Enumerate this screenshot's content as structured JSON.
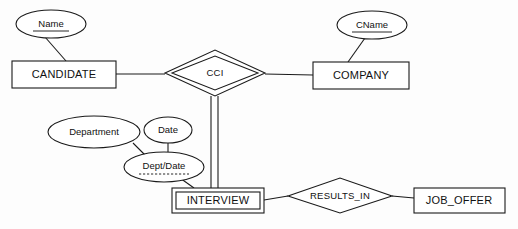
{
  "diagram": {
    "notation": "Chen",
    "background_color": "#fdfdfd",
    "line_color": "#1a1a1a",
    "text_color": "#111111"
  },
  "entities": [
    {
      "id": "candidate",
      "label": "CANDIDATE",
      "kind": "strong-entity",
      "x": 12,
      "y": 61,
      "w": 104,
      "h": 27
    },
    {
      "id": "company",
      "label": "COMPANY",
      "kind": "strong-entity",
      "x": 313,
      "y": 62,
      "w": 96,
      "h": 27
    },
    {
      "id": "interview",
      "label": "INTERVIEW",
      "kind": "weak-entity",
      "x": 172,
      "y": 188,
      "w": 92,
      "h": 25
    },
    {
      "id": "job_offer",
      "label": "JOB_OFFER",
      "kind": "strong-entity",
      "x": 414,
      "y": 188,
      "w": 91,
      "h": 25
    }
  ],
  "relationships": [
    {
      "id": "cci",
      "label": "CCI",
      "kind": "identifying-relationship",
      "cx": 215,
      "cy": 73,
      "rx": 50,
      "ry": 23
    },
    {
      "id": "results_in",
      "label": "RESULTS_IN",
      "kind": "relationship",
      "cx": 340,
      "cy": 195,
      "rx": 52,
      "ry": 17
    }
  ],
  "attributes": [
    {
      "id": "name",
      "label": "Name",
      "kind": "key-attribute",
      "underline": "solid",
      "cx": 51,
      "cy": 24,
      "rx": 35,
      "ry": 14
    },
    {
      "id": "cname",
      "label": "CName",
      "kind": "key-attribute",
      "underline": "solid",
      "cx": 372,
      "cy": 25,
      "rx": 35,
      "ry": 14
    },
    {
      "id": "department",
      "label": "Department",
      "kind": "attribute",
      "underline": "none",
      "cx": 94,
      "cy": 132,
      "rx": 46,
      "ry": 16
    },
    {
      "id": "date",
      "label": "Date",
      "kind": "attribute",
      "underline": "none",
      "cx": 168,
      "cy": 130,
      "rx": 24,
      "ry": 13
    },
    {
      "id": "dept_date",
      "label": "Dept/Date",
      "kind": "partial-key-attribute",
      "underline": "dashed",
      "cx": 164,
      "cy": 167,
      "rx": 40,
      "ry": 15
    }
  ],
  "connections": [
    {
      "id": "name-candidate",
      "from": "name",
      "to": "candidate",
      "style": "single"
    },
    {
      "id": "candidate-cci",
      "from": "candidate",
      "to": "cci",
      "style": "single"
    },
    {
      "id": "cci-company",
      "from": "cci",
      "to": "company",
      "style": "single"
    },
    {
      "id": "cname-company",
      "from": "cname",
      "to": "company",
      "style": "single"
    },
    {
      "id": "cci-interview",
      "from": "cci",
      "to": "interview",
      "style": "double"
    },
    {
      "id": "department-deptdate",
      "from": "department",
      "to": "dept_date",
      "style": "single"
    },
    {
      "id": "date-deptdate",
      "from": "date",
      "to": "dept_date",
      "style": "single"
    },
    {
      "id": "deptdate-interview",
      "from": "dept_date",
      "to": "interview",
      "style": "single"
    },
    {
      "id": "interview-resultsin",
      "from": "interview",
      "to": "results_in",
      "style": "single"
    },
    {
      "id": "resultsin-joboffer",
      "from": "results_in",
      "to": "job_offer",
      "style": "single"
    }
  ]
}
